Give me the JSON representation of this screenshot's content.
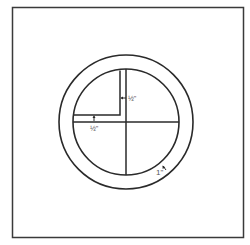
{
  "diagram": {
    "type": "concentric-circle-crosshair",
    "colors": {
      "stroke": "#2a2a2a",
      "frame": "#3a3a3a",
      "label": "#555555",
      "background": "#ffffff"
    },
    "labels": {
      "vertical_offset": "½\"",
      "horizontal_offset": "½\"",
      "ring_width": "1\""
    }
  }
}
